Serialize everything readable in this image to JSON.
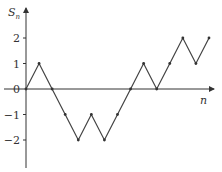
{
  "chart_data": {
    "type": "line",
    "title": "",
    "xlabel": "n",
    "ylabel": "S_n",
    "ylabel_main": "S",
    "ylabel_sub": "n",
    "x": [
      0,
      1,
      2,
      3,
      4,
      5,
      6,
      7,
      8,
      9,
      10,
      11,
      12,
      13,
      14
    ],
    "series": [
      {
        "name": "S_n",
        "values": [
          0,
          1,
          0,
          -1,
          -2,
          -1,
          -2,
          -1,
          0,
          1,
          0,
          1,
          2,
          1,
          2
        ]
      }
    ],
    "yticks": [
      -2,
      -1,
      0,
      1,
      2
    ],
    "ytick_labels": [
      "−2",
      "−1",
      "0",
      "1",
      "2"
    ],
    "ylim": [
      -3,
      3
    ],
    "grid": false,
    "legend": false,
    "markers": true,
    "line_color": "#444444"
  }
}
